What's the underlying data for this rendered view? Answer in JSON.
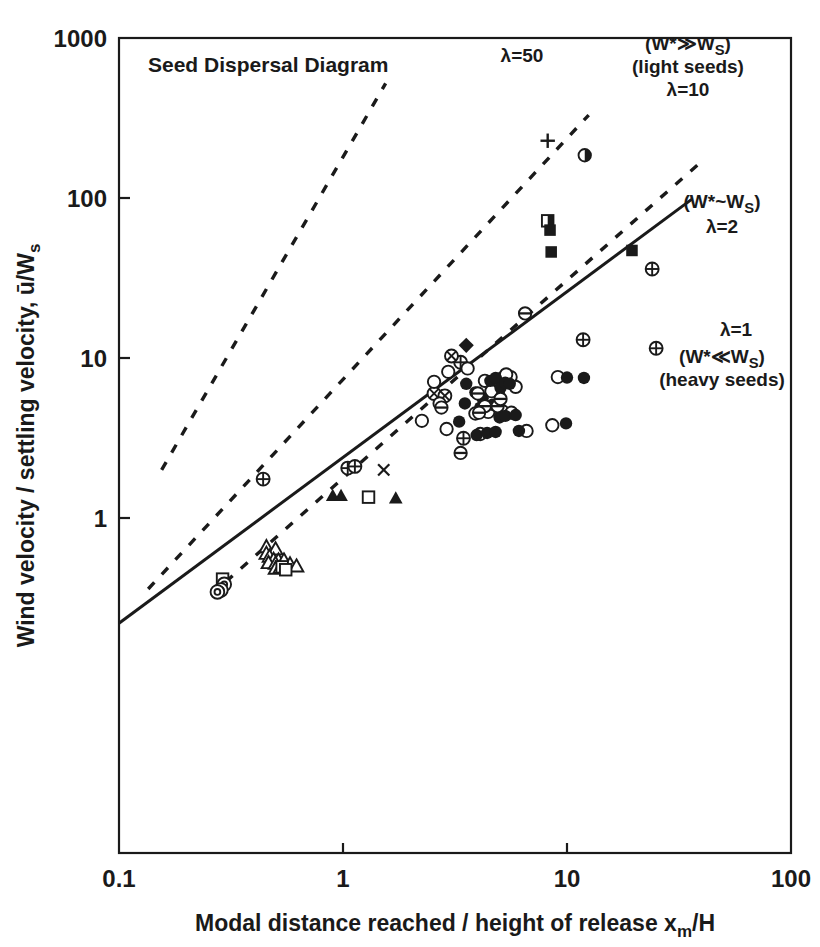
{
  "figure": {
    "title": "Seed Dispersal Diagram",
    "background": "#ffffff",
    "ink": "#1a1a1a"
  },
  "axes": {
    "x": {
      "label_parts": {
        "main": "Modal distance reached / height of release x",
        "sub": "m",
        "tail": "/H"
      },
      "label_full": "Modal distance reached / height of release xm/H",
      "ticks": [
        "0.1",
        "1",
        "10",
        "100"
      ],
      "min": 0.1,
      "max": 100,
      "scale": "log"
    },
    "y": {
      "label_parts": {
        "main": "Wind velocity / settling velocity, ū/W",
        "sub": "s"
      },
      "label_full": "Wind velocity / settling velocity, ū/Ws",
      "ticks": [
        "1",
        "10",
        "100",
        "1000"
      ],
      "min": 0.22,
      "max": 1000,
      "scale": "log"
    }
  },
  "annotations": [
    {
      "id": "lambda-50",
      "text": "λ=50",
      "x": 522,
      "y": 62,
      "anchor": "middle",
      "size": 19
    },
    {
      "id": "w-much-greater",
      "text": "(W*≫W",
      "sub": "S",
      "tail": ")",
      "x": 688,
      "y": 50,
      "anchor": "middle",
      "size": 19
    },
    {
      "id": "light-seeds",
      "text": "(light seeds)",
      "x": 688,
      "y": 73,
      "anchor": "middle",
      "size": 19
    },
    {
      "id": "lambda-10",
      "text": "λ=10",
      "x": 688,
      "y": 96,
      "anchor": "middle",
      "size": 19
    },
    {
      "id": "w-similar",
      "text": "(W*~W",
      "sub": "S",
      "tail": ")",
      "x": 722,
      "y": 208,
      "anchor": "middle",
      "size": 19
    },
    {
      "id": "lambda-2",
      "text": "λ=2",
      "x": 722,
      "y": 233,
      "anchor": "middle",
      "size": 19
    },
    {
      "id": "lambda-1",
      "text": "λ=1",
      "x": 736,
      "y": 336,
      "anchor": "middle",
      "size": 19
    },
    {
      "id": "w-much-less",
      "text": "(W*≪W",
      "sub": "S",
      "tail": ")",
      "x": 722,
      "y": 363,
      "anchor": "middle",
      "size": 19
    },
    {
      "id": "heavy-seeds",
      "text": "(heavy seeds)",
      "x": 722,
      "y": 386,
      "anchor": "middle",
      "size": 19
    }
  ],
  "chart_data": {
    "type": "scatter",
    "title": "Seed Dispersal Diagram",
    "xlabel": "Modal distance reached / height of release xm/H",
    "ylabel": "Wind velocity / settling velocity, ū/Ws",
    "xscale": "log",
    "yscale": "log",
    "xlim": [
      0.1,
      100
    ],
    "ylim": [
      0.22,
      1000
    ],
    "xticks": [
      0.1,
      1,
      10,
      100
    ],
    "yticks": [
      1,
      10,
      100,
      1000
    ],
    "grid": false,
    "legend": "none",
    "lines": [
      {
        "name": "lambda-50",
        "label": "λ=50",
        "style": "dashed",
        "x": [
          0.155,
          1.55
        ],
        "y": [
          2.0,
          520.0
        ]
      },
      {
        "name": "lambda-10",
        "label": "λ=10",
        "style": "dashed",
        "x": [
          0.135,
          12.5
        ],
        "y": [
          0.36,
          330.0
        ]
      },
      {
        "name": "lambda-2",
        "label": "λ=2",
        "style": "dashed",
        "x": [
          0.3,
          40.0
        ],
        "y": [
          0.4,
          170.0
        ]
      },
      {
        "name": "lambda-1",
        "label": "λ=1",
        "style": "solid",
        "x": [
          0.1,
          36.0
        ],
        "y": [
          0.22,
          98.0
        ]
      }
    ],
    "series": [
      {
        "name": "plus",
        "marker": "plus",
        "points": [
          [
            8.2,
            228
          ]
        ]
      },
      {
        "name": "half-filled-circle",
        "marker": "half-circle",
        "points": [
          [
            12.0,
            185
          ]
        ]
      },
      {
        "name": "half-filled-square",
        "marker": "half-square",
        "points": [
          [
            8.2,
            72
          ]
        ]
      },
      {
        "name": "filled-square",
        "marker": "filled-square",
        "points": [
          [
            8.4,
            63
          ],
          [
            8.5,
            46
          ],
          [
            19.5,
            47
          ]
        ]
      },
      {
        "name": "filled-diamond",
        "marker": "filled-diamond",
        "points": [
          [
            3.55,
            12.0
          ]
        ]
      },
      {
        "name": "crossed-circle-plus",
        "marker": "circle-plus",
        "points": [
          [
            24.0,
            36.0
          ],
          [
            25.0,
            11.5
          ],
          [
            11.8,
            13.0
          ],
          [
            0.44,
            1.75
          ],
          [
            1.05,
            2.05
          ],
          [
            3.35,
            9.4
          ],
          [
            3.45,
            3.15
          ],
          [
            1.13,
            2.1
          ]
        ]
      },
      {
        "name": "crossed-circle-x",
        "marker": "circle-x",
        "points": [
          [
            3.05,
            10.3
          ],
          [
            2.55,
            6.0
          ],
          [
            2.85,
            5.8
          ],
          [
            4.9,
            6.2
          ]
        ]
      },
      {
        "name": "open-circle",
        "marker": "open-circle",
        "points": [
          [
            2.25,
            4.05
          ],
          [
            2.55,
            7.1
          ],
          [
            2.95,
            8.2
          ],
          [
            3.6,
            8.6
          ],
          [
            4.3,
            7.2
          ],
          [
            4.6,
            6.2
          ],
          [
            5.1,
            7.4
          ],
          [
            5.6,
            7.6
          ],
          [
            5.9,
            6.6
          ],
          [
            2.7,
            5.2
          ],
          [
            2.9,
            3.6
          ],
          [
            3.9,
            4.5
          ],
          [
            4.45,
            4.6
          ],
          [
            5.15,
            4.65
          ],
          [
            5.65,
            4.55
          ],
          [
            4.1,
            3.35
          ],
          [
            6.6,
            3.5
          ],
          [
            8.6,
            3.8
          ],
          [
            5.35,
            7.9
          ],
          [
            9.1,
            7.6
          ]
        ]
      },
      {
        "name": "filled-circle",
        "marker": "filled-circle",
        "points": [
          [
            3.3,
            4.0
          ],
          [
            3.55,
            6.9
          ],
          [
            3.9,
            6.1
          ],
          [
            4.2,
            5.6
          ],
          [
            4.55,
            7.2
          ],
          [
            4.8,
            7.5
          ],
          [
            5.05,
            6.5
          ],
          [
            5.3,
            7.0
          ],
          [
            5.55,
            6.9
          ],
          [
            3.5,
            5.2
          ],
          [
            4.1,
            4.9
          ],
          [
            4.65,
            5.1
          ],
          [
            5.0,
            4.25
          ],
          [
            5.3,
            4.35
          ],
          [
            3.95,
            3.3
          ],
          [
            4.4,
            3.4
          ],
          [
            4.8,
            3.45
          ],
          [
            6.1,
            3.5
          ],
          [
            10.0,
            7.55
          ],
          [
            11.9,
            7.5
          ],
          [
            9.9,
            3.9
          ],
          [
            5.9,
            4.4
          ]
        ]
      },
      {
        "name": "circle-horizontal-line",
        "marker": "circle-hline",
        "points": [
          [
            6.5,
            19.0
          ],
          [
            4.0,
            6.0
          ],
          [
            4.3,
            5.0
          ],
          [
            4.9,
            5.0
          ],
          [
            4.05,
            4.55
          ],
          [
            3.35,
            2.55
          ],
          [
            2.75,
            4.9
          ],
          [
            5.05,
            5.55
          ]
        ]
      },
      {
        "name": "open-triangle",
        "marker": "open-triangle",
        "points": [
          [
            0.455,
            0.66
          ],
          [
            0.5,
            0.64
          ],
          [
            0.455,
            0.6
          ],
          [
            0.47,
            0.575
          ],
          [
            0.49,
            0.55
          ],
          [
            0.515,
            0.545
          ],
          [
            0.545,
            0.545
          ],
          [
            0.465,
            0.525
          ],
          [
            0.5,
            0.52
          ],
          [
            0.58,
            0.515
          ],
          [
            0.5,
            0.485
          ],
          [
            0.525,
            0.49
          ],
          [
            0.62,
            0.5
          ]
        ]
      },
      {
        "name": "filled-triangle",
        "marker": "filled-triangle",
        "points": [
          [
            0.9,
            1.38
          ],
          [
            0.98,
            1.38
          ],
          [
            1.72,
            1.33
          ]
        ]
      },
      {
        "name": "open-square",
        "marker": "open-square",
        "points": [
          [
            1.3,
            1.35
          ],
          [
            0.535,
            0.495
          ],
          [
            0.555,
            0.475
          ],
          [
            0.29,
            0.415
          ]
        ]
      },
      {
        "name": "circle-dot",
        "marker": "circle-dot",
        "points": [
          [
            0.295,
            0.385
          ],
          [
            0.285,
            0.355
          ],
          [
            0.275,
            0.345
          ]
        ]
      },
      {
        "name": "x-cross",
        "marker": "x",
        "points": [
          [
            1.52,
            2.0
          ]
        ]
      }
    ]
  }
}
